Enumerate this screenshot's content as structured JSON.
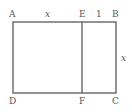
{
  "diagram": {
    "type": "geometry-figure",
    "points": {
      "A": "A",
      "B": "B",
      "C": "C",
      "D": "D",
      "E": "E",
      "F": "F"
    },
    "segment_labels": {
      "AE": "x",
      "EB": "1",
      "BC": "x"
    },
    "segments": [
      "AB",
      "BC",
      "CD",
      "DA",
      "EF"
    ],
    "line_color": "#5a5a5a",
    "label_color": "#555555"
  }
}
